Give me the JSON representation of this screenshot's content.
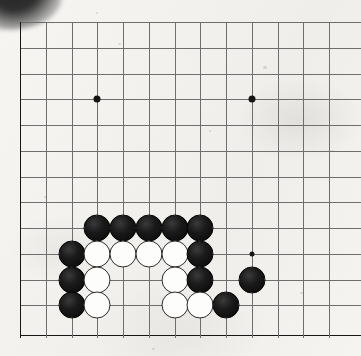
{
  "app": {
    "title": "Go board diagram",
    "description": "Scanned go (baduk) board diagram, lower-left corner region",
    "board_size": 19,
    "visible_columns": 13,
    "visible_rows": 13
  },
  "colors": {
    "background": "#f4f3f0",
    "grid_line": "#6e6e70",
    "board_edge": "#171717",
    "black_stone": "#121212",
    "white_stone": "#fdfdfb",
    "white_stone_outline": "#2b2b2b",
    "star_point": "#141414"
  },
  "geometry": {
    "origin_x": 20,
    "origin_y": 22,
    "spacing_x": 25.75,
    "spacing_y": 25.75,
    "cols": 13,
    "rows": 13,
    "stone_diameter": 27,
    "edge_left_x": 20,
    "edge_bottom_y": 335
  },
  "star_points": [
    {
      "name": "star-point-upper-left",
      "col": 3,
      "row": 3,
      "size": "normal"
    },
    {
      "name": "star-point-upper-right",
      "col": 9,
      "row": 3,
      "size": "normal"
    },
    {
      "name": "star-point-lower-right",
      "col": 9,
      "row": 9,
      "size": "small"
    }
  ],
  "stones": [
    {
      "name": "black-stone-c3-r8",
      "color": "black",
      "col": 3,
      "row": 8
    },
    {
      "name": "black-stone-c4-r8",
      "color": "black",
      "col": 4,
      "row": 8
    },
    {
      "name": "black-stone-c5-r8",
      "color": "black",
      "col": 5,
      "row": 8
    },
    {
      "name": "black-stone-c6-r8",
      "color": "black",
      "col": 6,
      "row": 8
    },
    {
      "name": "black-stone-c7-r8",
      "color": "black",
      "col": 7,
      "row": 8
    },
    {
      "name": "black-stone-c2-r9",
      "color": "black",
      "col": 2,
      "row": 9
    },
    {
      "name": "white-stone-c3-r9",
      "color": "white",
      "col": 3,
      "row": 9
    },
    {
      "name": "white-stone-c4-r9",
      "color": "white",
      "col": 4,
      "row": 9
    },
    {
      "name": "white-stone-c5-r9",
      "color": "white",
      "col": 5,
      "row": 9
    },
    {
      "name": "white-stone-c6-r9",
      "color": "white",
      "col": 6,
      "row": 9
    },
    {
      "name": "black-stone-c7-r9",
      "color": "black",
      "col": 7,
      "row": 9
    },
    {
      "name": "black-stone-c2-r10",
      "color": "black",
      "col": 2,
      "row": 10
    },
    {
      "name": "white-stone-c3-r10",
      "color": "white",
      "col": 3,
      "row": 10
    },
    {
      "name": "white-stone-c6-r10",
      "color": "white",
      "col": 6,
      "row": 10
    },
    {
      "name": "black-stone-c7-r10",
      "color": "black",
      "col": 7,
      "row": 10
    },
    {
      "name": "black-stone-c9-r10",
      "color": "black",
      "col": 9,
      "row": 10
    },
    {
      "name": "black-stone-c2-r11",
      "color": "black",
      "col": 2,
      "row": 11
    },
    {
      "name": "white-stone-c3-r11",
      "color": "white",
      "col": 3,
      "row": 11
    },
    {
      "name": "white-stone-c6-r11",
      "color": "white",
      "col": 6,
      "row": 11
    },
    {
      "name": "white-stone-c7-r11",
      "color": "white",
      "col": 7,
      "row": 11
    },
    {
      "name": "black-stone-c8-r11",
      "color": "black",
      "col": 8,
      "row": 11
    }
  ],
  "specks": [
    {
      "x": 118,
      "y": 43,
      "w": 3,
      "h": 2
    },
    {
      "x": 263,
      "y": 66,
      "w": 4,
      "h": 3
    },
    {
      "x": 331,
      "y": 150,
      "w": 3,
      "h": 2
    },
    {
      "x": 44,
      "y": 196,
      "w": 3,
      "h": 2
    },
    {
      "x": 209,
      "y": 130,
      "w": 2,
      "h": 2
    },
    {
      "x": 300,
      "y": 292,
      "w": 4,
      "h": 2
    },
    {
      "x": 152,
      "y": 348,
      "w": 3,
      "h": 2
    },
    {
      "x": 96,
      "y": 12,
      "w": 2,
      "h": 2
    }
  ]
}
